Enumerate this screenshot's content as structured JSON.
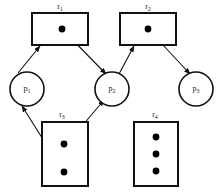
{
  "diagram": {
    "type": "resource-allocation-graph",
    "width": 216,
    "height": 196,
    "colors": {
      "background": "#ffffff",
      "stroke": "#111111",
      "token": "#000000",
      "text": "#1a1a1a"
    },
    "resources": [
      {
        "id": "r1",
        "label": "r",
        "subscript": "1",
        "shape": "rectangle",
        "x": 32,
        "y": 13,
        "width": 56,
        "height": 32,
        "tokens": 1,
        "token_positions": [
          [
            62,
            29
          ]
        ],
        "label_x": 60,
        "label_y": 3
      },
      {
        "id": "r2",
        "label": "r",
        "subscript": "2",
        "shape": "rectangle",
        "x": 120,
        "y": 13,
        "width": 56,
        "height": 32,
        "tokens": 1,
        "token_positions": [
          [
            148,
            29
          ]
        ],
        "label_x": 148,
        "label_y": 3
      },
      {
        "id": "r3",
        "label": "r",
        "subscript": "3",
        "shape": "rectangle",
        "x": 42,
        "y": 122,
        "width": 46,
        "height": 64,
        "tokens": 2,
        "token_positions": [
          [
            64,
            144
          ],
          [
            64,
            172
          ]
        ],
        "label_x": 62,
        "label_y": 111
      },
      {
        "id": "r4",
        "label": "r",
        "subscript": "4",
        "shape": "rectangle",
        "x": 134,
        "y": 122,
        "width": 44,
        "height": 64,
        "tokens": 3,
        "token_positions": [
          [
            156,
            137
          ],
          [
            156,
            154
          ],
          [
            156,
            171
          ]
        ],
        "label_x": 155,
        "label_y": 111
      }
    ],
    "processes": [
      {
        "id": "p1",
        "label": "p",
        "subscript": "1",
        "shape": "circle",
        "cx": 27,
        "cy": 89,
        "r": 17
      },
      {
        "id": "p2",
        "label": "p",
        "subscript": "2",
        "shape": "circle",
        "cx": 112,
        "cy": 89,
        "r": 17
      },
      {
        "id": "p3",
        "label": "p",
        "subscript": "3",
        "shape": "circle",
        "cx": 196,
        "cy": 89,
        "r": 17
      }
    ],
    "edges": [
      {
        "id": "edge-r1-p1",
        "from": "r1",
        "to": "p1",
        "kind": "assignment",
        "arrow": true,
        "x1": 18,
        "y1": 73,
        "x2": 40,
        "y2": 46
      },
      {
        "id": "edge-r1-p2",
        "from": "r1",
        "to": "p2",
        "kind": "assignment",
        "arrow": true,
        "x1": 63,
        "y1": 30,
        "x2": 106,
        "y2": 74
      },
      {
        "id": "edge-p2-r2",
        "from": "p2",
        "to": "r2",
        "kind": "request",
        "arrow": true,
        "x1": 119,
        "y1": 74,
        "x2": 134,
        "y2": 46
      },
      {
        "id": "edge-r2-p3",
        "from": "r2",
        "to": "p3",
        "kind": "assignment",
        "arrow": true,
        "x1": 149,
        "y1": 30,
        "x2": 190,
        "y2": 74
      },
      {
        "id": "edge-r3-p1",
        "from": "r3",
        "to": "p1",
        "kind": "assignment",
        "arrow": true,
        "x1": 56,
        "y1": 160,
        "x2": 22,
        "y2": 106
      },
      {
        "id": "edge-r3-p2",
        "from": "r3",
        "to": "p2",
        "kind": "assignment",
        "arrow": true,
        "x1": 66,
        "y1": 145,
        "x2": 104,
        "y2": 100
      }
    ]
  }
}
